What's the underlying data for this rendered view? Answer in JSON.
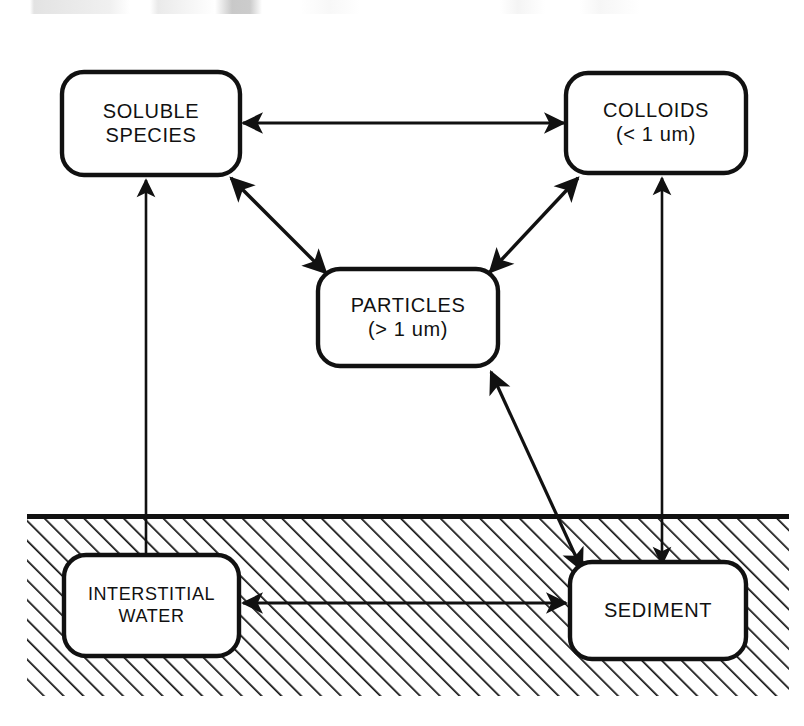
{
  "diagram": {
    "colors": {
      "stroke": "#111111",
      "fill": "#ffffff",
      "hatch": "#111111",
      "background": "#ffffff"
    },
    "regions": [
      {
        "id": "sediment-region",
        "name": "sediment-hatch-region",
        "label": "",
        "x": 27,
        "y": 514,
        "width": 762,
        "height": 182
      }
    ],
    "nodes": [
      {
        "id": "soluble-species",
        "name": "node-soluble-species",
        "lines": [
          "SOLUBLE",
          "SPECIES"
        ],
        "x": 62,
        "y": 72,
        "width": 178,
        "height": 103
      },
      {
        "id": "colloids",
        "name": "node-colloids",
        "lines": [
          "COLLOIDS",
          "(< 1 um)"
        ],
        "x": 566,
        "y": 73,
        "width": 180,
        "height": 100
      },
      {
        "id": "particles",
        "name": "node-particles",
        "lines": [
          "PARTICLES",
          "(> 1 um)"
        ],
        "x": 318,
        "y": 269,
        "width": 180,
        "height": 97
      },
      {
        "id": "interstitial-water",
        "name": "node-interstitial-water",
        "lines": [
          "INTERSTITIAL",
          "WATER"
        ],
        "x": 64,
        "y": 555,
        "width": 175,
        "height": 101
      },
      {
        "id": "sediment",
        "name": "node-sediment",
        "lines": [
          "SEDIMENT"
        ],
        "x": 570,
        "y": 562,
        "width": 176,
        "height": 97
      }
    ],
    "edges": [
      {
        "id": "soluble-colloids",
        "name": "arrow-soluble-species-colloids",
        "from": "soluble-species",
        "to": "colloids",
        "heads": "both",
        "x1": 243,
        "y1": 123,
        "x2": 564,
        "y2": 123
      },
      {
        "id": "soluble-particles",
        "name": "arrow-soluble-species-particles",
        "from": "soluble-species",
        "to": "particles",
        "heads": "both",
        "x1": 230,
        "y1": 177,
        "x2": 325,
        "y2": 272
      },
      {
        "id": "colloids-particles",
        "name": "arrow-colloids-particles",
        "from": "colloids",
        "to": "particles",
        "heads": "both",
        "x1": 578,
        "y1": 177,
        "x2": 489,
        "y2": 272
      },
      {
        "id": "interstitial-soluble",
        "name": "arrow-interstitial-water-soluble-species",
        "from": "interstitial-water",
        "to": "soluble-species",
        "heads": "end",
        "x1": 146,
        "y1": 553,
        "x2": 146,
        "y2": 178
      },
      {
        "id": "sediment-colloids",
        "name": "arrow-sediment-colloids",
        "from": "sediment",
        "to": "colloids",
        "heads": "both",
        "x1": 662,
        "y1": 562,
        "x2": 662,
        "y2": 176
      },
      {
        "id": "sediment-particles",
        "name": "arrow-sediment-particles",
        "from": "sediment",
        "to": "particles",
        "heads": "both",
        "x1": 580,
        "y1": 568,
        "x2": 490,
        "y2": 371
      },
      {
        "id": "interstitial-sediment",
        "name": "arrow-interstitial-water-sediment",
        "from": "interstitial-water",
        "to": "sediment",
        "heads": "both",
        "x1": 242,
        "y1": 603,
        "x2": 567,
        "y2": 603
      }
    ]
  }
}
